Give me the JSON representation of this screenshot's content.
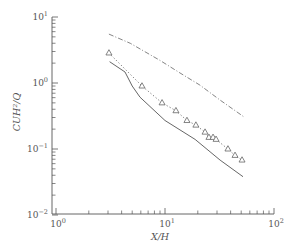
{
  "chart_data": {
    "type": "line",
    "title": "",
    "xlabel": "X/H",
    "ylabel": "CUH²/Q",
    "xscale": "log",
    "yscale": "log",
    "xlim": [
      1,
      100
    ],
    "ylim": [
      0.01,
      10
    ],
    "grid": false,
    "legend": null,
    "x_ticks": [
      {
        "value": 1,
        "base": "10",
        "exp": "0"
      },
      {
        "value": 10,
        "base": "10",
        "exp": "1"
      },
      {
        "value": 100,
        "base": "10",
        "exp": "2"
      }
    ],
    "y_ticks": [
      {
        "value": 0.01,
        "base": "10",
        "exp": "−2"
      },
      {
        "value": 0.1,
        "base": "10",
        "exp": "−1"
      },
      {
        "value": 1,
        "base": "10",
        "exp": "0"
      },
      {
        "value": 10,
        "base": "10",
        "exp": "1"
      }
    ],
    "series": [
      {
        "name": "upper bound (dash-dot)",
        "style": "dashdot",
        "color": "#777777",
        "x": [
          3.06,
          4.8,
          9.0,
          13.7,
          20.9,
          32,
          54
        ],
        "y": [
          5.5,
          4.0,
          2.2,
          1.42,
          0.93,
          0.55,
          0.3
        ]
      },
      {
        "name": "measured (triangles, dotted)",
        "style": "dotted",
        "marker": "triangle",
        "color": "#666666",
        "x": [
          3.06,
          6.15,
          9.4,
          12.6,
          15.9,
          19.2,
          23.3,
          25.3,
          27.6,
          29.4,
          37.8,
          43.9,
          50.9
        ],
        "y": [
          2.85,
          0.9,
          0.5,
          0.38,
          0.27,
          0.23,
          0.18,
          0.15,
          0.15,
          0.14,
          0.1,
          0.08,
          0.068
        ]
      },
      {
        "name": "model (solid)",
        "style": "solid",
        "color": "#555555",
        "x": [
          3.1,
          4.3,
          5.0,
          5.9,
          10,
          18.9,
          32,
          52
        ],
        "y": [
          2.1,
          1.47,
          0.9,
          0.61,
          0.27,
          0.14,
          0.068,
          0.038
        ]
      }
    ]
  }
}
